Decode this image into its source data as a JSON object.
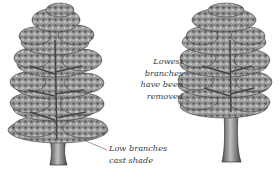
{
  "figure": {
    "colors": {
      "ink": "#3a3a3a",
      "foliage_dark": "#4a4a4a",
      "foliage_mid": "#8a8a8a",
      "foliage_light": "#c8c8c8",
      "background": "#ffffff"
    },
    "trees": [
      {
        "id": "left",
        "name": "tree-with-low-branches"
      },
      {
        "id": "right",
        "name": "tree-with-lowest-branches-removed"
      }
    ],
    "annotations": {
      "removed": {
        "lines": [
          "Lowest",
          "branches",
          "have been",
          "removed"
        ]
      },
      "shade": {
        "lines": [
          "Low branches",
          "cast shade"
        ]
      }
    }
  }
}
